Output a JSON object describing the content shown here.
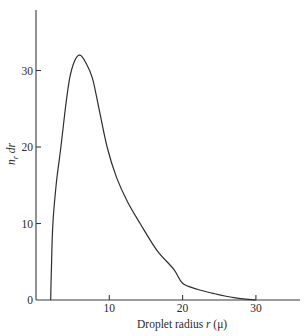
{
  "chart_data": {
    "type": "line",
    "title": "",
    "xlabel": "Droplet radius r (μ)",
    "xlabel_parts": {
      "pre": "Droplet radius ",
      "var": "r",
      "post": " (μ)"
    },
    "ylabel": "n_r dr",
    "ylabel_parts": {
      "n": "n",
      "sub": "r",
      "post": " dr"
    },
    "xlim": [
      0,
      36
    ],
    "ylim": [
      0,
      37
    ],
    "xticks": [
      10,
      20,
      30
    ],
    "xtick_labels": [
      "10",
      "20",
      "30"
    ],
    "yticks": [
      0,
      10,
      20,
      30
    ],
    "ytick_labels": [
      "0",
      "10",
      "20",
      "30"
    ],
    "grid": false,
    "legend": null,
    "series": [
      {
        "name": "droplet size distribution",
        "x": [
          2.0,
          2.1,
          2.3,
          2.8,
          3.4,
          4.0,
          4.6,
          5.3,
          6.0,
          6.8,
          7.7,
          8.6,
          9.7,
          11.0,
          12.5,
          14.2,
          16.5,
          18.8,
          20.0,
          22.0,
          24.0,
          27.0,
          30.0
        ],
        "y": [
          0.0,
          4.0,
          10.0,
          15.5,
          20.0,
          25.0,
          29.0,
          31.3,
          32.0,
          31.0,
          29.0,
          25.0,
          20.0,
          16.0,
          12.8,
          10.0,
          6.5,
          4.0,
          2.2,
          1.4,
          0.9,
          0.3,
          0.0
        ]
      }
    ]
  }
}
